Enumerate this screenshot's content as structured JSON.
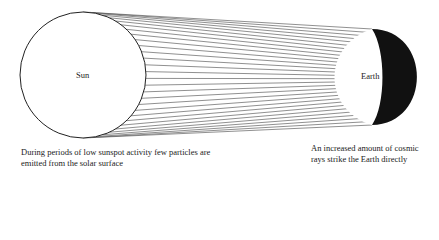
{
  "diagram": {
    "sun": {
      "label": "Sun"
    },
    "earth": {
      "label": "Earth"
    },
    "captions": {
      "left": "During periods of low sunspot activity few particles are emitted from the solar surface",
      "right": "An increased amount of cosmic rays strike the Earth directly"
    },
    "colors": {
      "line": "#333333",
      "earth_shadow": "#111111",
      "background": "#ffffff"
    },
    "ray_count": 30
  }
}
